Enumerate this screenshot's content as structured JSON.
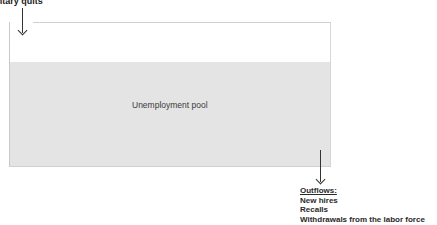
{
  "diagram": {
    "inflow_label": "Voluntary quits",
    "pool_label": "Unemployment pool",
    "outflows": {
      "title": "Outflows:",
      "items": [
        "New hires",
        "Recalls",
        "Withdrawals from the labor force"
      ]
    },
    "colors": {
      "pool_fill": "#e4e4e4",
      "border": "#cccccc",
      "text": "#2a2a2a"
    }
  }
}
